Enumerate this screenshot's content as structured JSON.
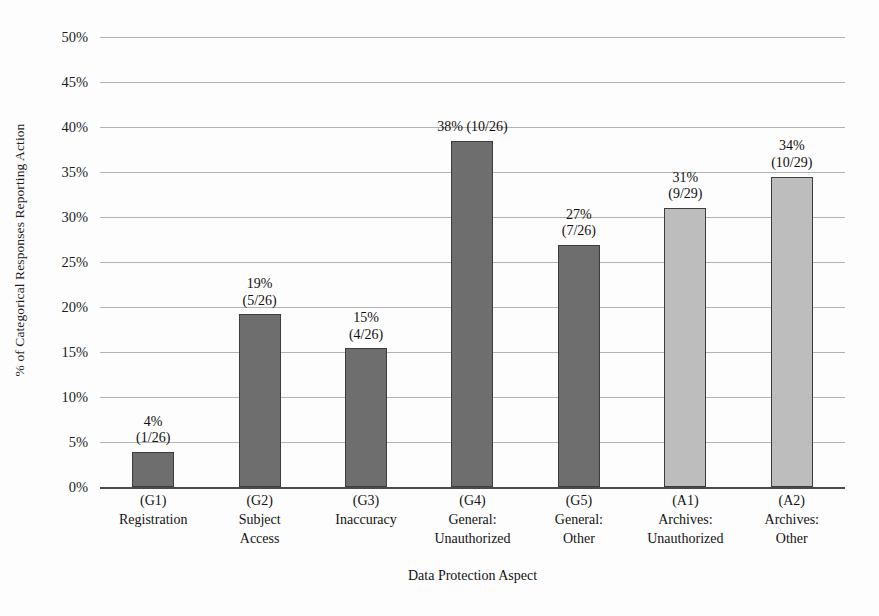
{
  "chart_data": {
    "type": "bar",
    "title": "",
    "xlabel": "Data Protection Aspect",
    "ylabel": "% of Categorical Responses Reporting Action",
    "ylim": [
      0,
      50
    ],
    "ytick_labels": [
      "0%",
      "5%",
      "10%",
      "15%",
      "20%",
      "25%",
      "30%",
      "35%",
      "40%",
      "45%",
      "50%"
    ],
    "ytick_values": [
      0,
      5,
      10,
      15,
      20,
      25,
      30,
      35,
      40,
      45,
      50
    ],
    "grid": true,
    "legend": "none",
    "categories": [
      "(G1) Registration",
      "(G2) Subject Access",
      "(G3) Inaccuracy",
      "(G4) General: Unauthorized",
      "(G5) General: Other",
      "(A1) Archives: Unauthorized",
      "(A2) Archives: Other"
    ],
    "values": [
      3.9,
      19.2,
      15.4,
      38.5,
      26.9,
      31.0,
      34.5
    ],
    "bars": [
      {
        "code": "(G1)",
        "name": "Registration",
        "name2": "",
        "value": 3.9,
        "label_pct": "4%",
        "label_frac": "(1/26)",
        "label_inline": false,
        "group": "general",
        "color": "#6e6e6e"
      },
      {
        "code": "(G2)",
        "name": "Subject",
        "name2": "Access",
        "value": 19.2,
        "label_pct": "19%",
        "label_frac": "(5/26)",
        "label_inline": false,
        "group": "general",
        "color": "#6e6e6e"
      },
      {
        "code": "(G3)",
        "name": "Inaccuracy",
        "name2": "",
        "value": 15.4,
        "label_pct": "15%",
        "label_frac": "(4/26)",
        "label_inline": false,
        "group": "general",
        "color": "#6e6e6e"
      },
      {
        "code": "(G4)",
        "name": "General:",
        "name2": "Unauthorized",
        "value": 38.5,
        "label_pct": "38% (10/26)",
        "label_frac": "",
        "label_inline": true,
        "group": "general",
        "color": "#6e6e6e"
      },
      {
        "code": "(G5)",
        "name": "General:",
        "name2": "Other",
        "value": 26.9,
        "label_pct": "27%",
        "label_frac": "(7/26)",
        "label_inline": false,
        "group": "general",
        "color": "#6e6e6e"
      },
      {
        "code": "(A1)",
        "name": "Archives:",
        "name2": "Unauthorized",
        "value": 31.0,
        "label_pct": "31%",
        "label_frac": "(9/29)",
        "label_inline": false,
        "group": "archives",
        "color": "#bdbdbd"
      },
      {
        "code": "(A2)",
        "name": "Archives:",
        "name2": "Other",
        "value": 34.5,
        "label_pct": "34%",
        "label_frac": "(10/29)",
        "label_inline": false,
        "group": "archives",
        "color": "#bdbdbd"
      }
    ],
    "colors": {
      "general_bar": "#6e6e6e",
      "archives_bar": "#bdbdbd",
      "bar_outline": "#3d3d3d",
      "gridline": "#9a9a9a",
      "axis": "#4a4a4a",
      "text": "#121212",
      "background": "#fdfdfd"
    }
  }
}
